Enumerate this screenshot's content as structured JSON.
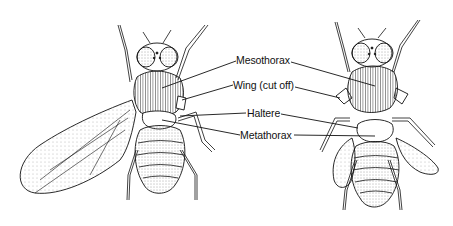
{
  "diagram": {
    "colors": {
      "ink": "#111111",
      "background": "#ffffff",
      "stipple": "#555555"
    },
    "labels": [
      {
        "id": "mesothorax",
        "text": "Mesothorax"
      },
      {
        "id": "wing",
        "text": "Wing (cut off)"
      },
      {
        "id": "haltere",
        "text": "Haltere"
      },
      {
        "id": "metathorax",
        "text": "Metathorax"
      }
    ],
    "figures": [
      {
        "id": "left-fly",
        "description": "Fly with one full wing extended"
      },
      {
        "id": "right-fly",
        "description": "Fly with wing cut off, halteres transformed into wing-like structures"
      }
    ]
  }
}
